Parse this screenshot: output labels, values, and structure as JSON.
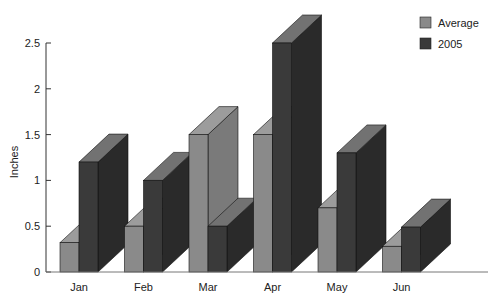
{
  "chart_data": {
    "type": "bar",
    "style": "3d-clustered",
    "title": "",
    "xlabel": "",
    "ylabel": "Inches",
    "categories": [
      "Jan",
      "Feb",
      "Mar",
      "Apr",
      "May",
      "Jun"
    ],
    "series": [
      {
        "name": "Average",
        "values": [
          0.32,
          0.5,
          1.5,
          1.5,
          0.7,
          0.28
        ],
        "color": "#8a8a8a"
      },
      {
        "name": "2005",
        "values": [
          1.2,
          1.0,
          0.5,
          2.5,
          1.3,
          0.49
        ],
        "color": "#3a3a3a"
      }
    ],
    "ylim": [
      0,
      2.5
    ],
    "yticks": [
      "0",
      "0.5",
      "1",
      "1.5",
      "2",
      "2.5"
    ],
    "grid": false,
    "legend_position": "top-right"
  },
  "legend": {
    "items": [
      {
        "label": "Average"
      },
      {
        "label": "2005"
      }
    ]
  },
  "axis": {
    "ylabel": "Inches"
  }
}
